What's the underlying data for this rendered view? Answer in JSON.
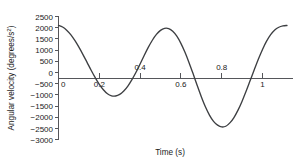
{
  "chart_data": {
    "type": "line",
    "title": "",
    "xlabel": "Time (s)",
    "ylabel": "Angular velocity (degrees/s²)",
    "xlim": [
      0,
      1.12
    ],
    "ylim": [
      -3000,
      2500
    ],
    "grid": false,
    "legend": "none",
    "x_ticks": [
      0,
      0.2,
      0.4,
      0.6,
      0.8,
      1
    ],
    "x_tick_labels": [
      "0",
      "0.2",
      "0.4",
      "0.6",
      "0.8",
      "1"
    ],
    "y_ticks": [
      2500,
      2000,
      1500,
      1000,
      500,
      0,
      -500,
      -1000,
      -1500,
      -2000,
      -2500,
      -3000
    ],
    "y_tick_labels": [
      "2500",
      "2000",
      "1500",
      "1000",
      "500",
      "0",
      "−500",
      "−1000",
      "−1500",
      "−2000",
      "−2500",
      "−3000"
    ],
    "series": [
      {
        "name": "angular velocity",
        "x": [
          0.0,
          0.02,
          0.04,
          0.06,
          0.08,
          0.1,
          0.12,
          0.14,
          0.16,
          0.18,
          0.2,
          0.22,
          0.24,
          0.26,
          0.28,
          0.3,
          0.32,
          0.34,
          0.36,
          0.38,
          0.4,
          0.42,
          0.44,
          0.46,
          0.48,
          0.5,
          0.52,
          0.54,
          0.56,
          0.58,
          0.6,
          0.62,
          0.64,
          0.66,
          0.68,
          0.7,
          0.72,
          0.74,
          0.76,
          0.78,
          0.8,
          0.82,
          0.84,
          0.86,
          0.88,
          0.9,
          0.92,
          0.94,
          0.96,
          0.98,
          1.0,
          1.02,
          1.04,
          1.06,
          1.08,
          1.1,
          1.12
        ],
        "y": [
          2100,
          2030,
          1890,
          1690,
          1430,
          1130,
          800,
          450,
          100,
          -230,
          -530,
          -770,
          -950,
          -1040,
          -1050,
          -980,
          -830,
          -610,
          -320,
          10,
          380,
          760,
          1120,
          1440,
          1700,
          1880,
          1970,
          1960,
          1840,
          1620,
          1300,
          900,
          440,
          -60,
          -580,
          -1080,
          -1530,
          -1900,
          -2180,
          -2350,
          -2430,
          -2400,
          -2250,
          -2010,
          -1680,
          -1280,
          -830,
          -350,
          130,
          600,
          1030,
          1400,
          1690,
          1900,
          2020,
          2080,
          2100
        ]
      }
    ],
    "annotations": [],
    "colors": {
      "curve": "#3d3f42",
      "axis": "#55565a",
      "text": "#1a1a1a",
      "background": "#ffffff"
    }
  }
}
